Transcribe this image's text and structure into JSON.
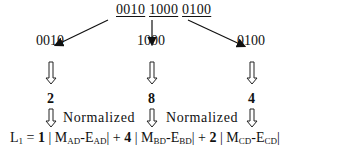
{
  "source": {
    "groups": [
      "0010",
      "1000",
      "0100"
    ]
  },
  "codes": [
    "0010",
    "1000",
    "0100"
  ],
  "values": [
    "2",
    "8",
    "4"
  ],
  "normalized_labels": [
    "Normalized",
    "Normalized"
  ],
  "formula": {
    "lhs": "L",
    "lhs_sub": "1",
    "equals": " = ",
    "terms": [
      {
        "coef": "1",
        "m": "M",
        "m_sub": "AD",
        "e": "E",
        "e_sub": "AD"
      },
      {
        "coef": "4",
        "m": "M",
        "m_sub": "BD",
        "e": "E",
        "e_sub": "BD"
      },
      {
        "coef": "2",
        "m": "M",
        "m_sub": "CD",
        "e": "E",
        "e_sub": "CD"
      }
    ],
    "plus": " + "
  }
}
